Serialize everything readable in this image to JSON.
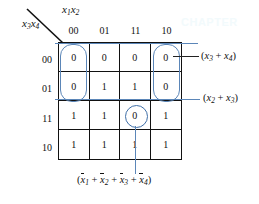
{
  "watermark": "CHAPTER",
  "axes": {
    "column_axis_label": "x1x2",
    "row_axis_label": "x3x4",
    "column_axis_base": "x",
    "column_axis_sub_a": "1",
    "column_axis_base_b": "x",
    "column_axis_sub_b": "2",
    "row_axis_base": "x",
    "row_axis_sub_a": "3",
    "row_axis_base_b": "x",
    "row_axis_sub_b": "4"
  },
  "kmap": {
    "column_headers": [
      "00",
      "01",
      "11",
      "10"
    ],
    "row_headers": [
      "00",
      "01",
      "11",
      "10"
    ],
    "rows": [
      [
        "0",
        "0",
        "0",
        "0"
      ],
      [
        "0",
        "1",
        "1",
        "0"
      ],
      [
        "1",
        "1",
        "0",
        "1"
      ],
      [
        "1",
        "1",
        "1",
        "1"
      ]
    ]
  },
  "annotations": {
    "group_right_top": {
      "open_paren": "(",
      "var1": "x",
      "sub1": "3",
      "plus": " + ",
      "var2": "x",
      "sub2": "4",
      "close_paren": ")"
    },
    "group_right_mid": {
      "open_paren": "(",
      "var1": "x",
      "sub1": "2",
      "plus": " + ",
      "var2": "x",
      "sub2": "3",
      "close_paren": ")"
    },
    "group_bottom": {
      "open_paren": "(",
      "var1": "x",
      "sub1": "1",
      "plus1": " + ",
      "var2": "x",
      "sub2": "2",
      "plus2": " + ",
      "var3": "x",
      "sub3": "3",
      "plus3": " + ",
      "var4": "x",
      "sub4": "4",
      "close_paren": ")"
    }
  },
  "colors": {
    "grid_line": "#111111",
    "annotation_blue": "#5b86b8",
    "circle_blue": "#3f6fa8",
    "text": "#111111",
    "background": "#ffffff"
  }
}
